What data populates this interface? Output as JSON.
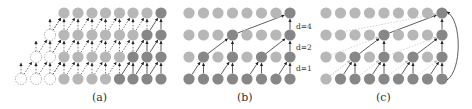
{
  "colors": {
    "light_node": "#b7b7b7",
    "dark_node": "#878787",
    "dashed_node_stroke": "#8a8a8a",
    "solid_edge": "#333333",
    "dashed_edge": "#555555",
    "faint_dashed_edge": "#c8c8c8"
  },
  "rows_y": [
    13,
    35,
    57,
    79
  ],
  "panels": [
    {
      "id": "a",
      "caption": "(a)",
      "caption_x": 100,
      "columns_x": [
        64,
        78,
        92,
        105.5,
        119.5,
        133,
        147,
        161
      ],
      "dark": [
        [
          7
        ],
        [
          6,
          7
        ],
        [
          5,
          6,
          7
        ],
        [
          4,
          5,
          6,
          7
        ]
      ],
      "dashed_nodes": [
        {
          "x": 50,
          "row": 1
        },
        {
          "x": 36,
          "row": 2
        },
        {
          "x": 50,
          "row": 2
        },
        {
          "x": 21,
          "row": 3
        },
        {
          "x": 36,
          "row": 3
        },
        {
          "x": 50,
          "row": 3
        }
      ]
    },
    {
      "id": "b",
      "caption": "(b)",
      "caption_x": 245,
      "columns_x": [
        189,
        203.5,
        218,
        232.5,
        247,
        261.5,
        276,
        290
      ],
      "dark": [
        [
          7
        ],
        [
          3,
          7
        ],
        [
          1,
          3,
          5,
          7
        ],
        [
          0,
          1,
          2,
          3,
          4,
          5,
          6,
          7
        ]
      ],
      "dilation_labels": [
        {
          "text": "d=4",
          "y": 29
        },
        {
          "text": "d=2",
          "y": 50
        },
        {
          "text": "d=1",
          "y": 71
        }
      ]
    },
    {
      "id": "c",
      "caption": "(c)",
      "caption_x": 384,
      "columns_x": [
        326,
        340.5,
        355,
        369.5,
        384,
        398.5,
        413,
        427.5,
        442
      ],
      "dark": [
        [
          8
        ],
        [
          4,
          8
        ],
        [
          2,
          4,
          6,
          8
        ],
        [
          1,
          2,
          3,
          4,
          5,
          6,
          7,
          8
        ]
      ]
    }
  ]
}
